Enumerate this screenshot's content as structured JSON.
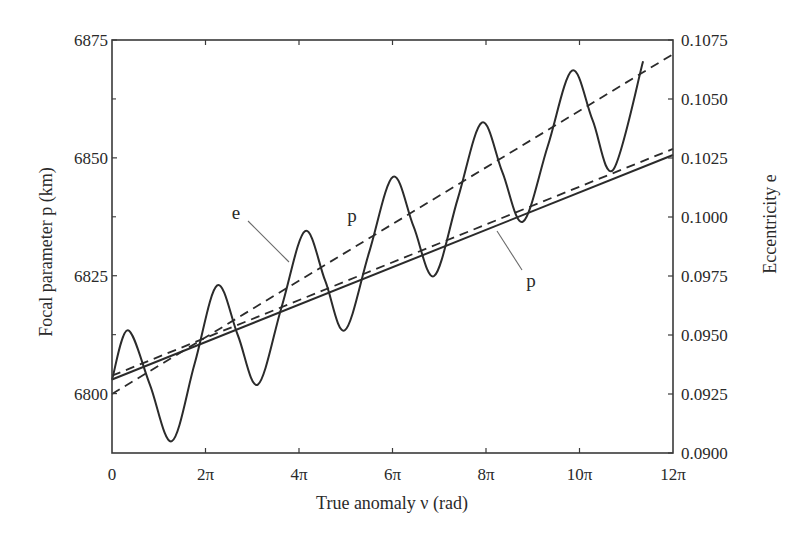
{
  "chart_data": {
    "type": "line",
    "title": "",
    "xlabel": "True anomaly ν (rad)",
    "ylabel": "Focal parameter p (km)",
    "ylabel_right": "Eccentricity e",
    "xlim_pi": [
      0,
      12
    ],
    "ylim": [
      6787.4,
      6875
    ],
    "ylim_right": [
      0.09,
      0.1075
    ],
    "grid": false,
    "legend": null,
    "x_ticks": [
      {
        "value_pi": 0,
        "label": "0"
      },
      {
        "value_pi": 2,
        "label": "2π"
      },
      {
        "value_pi": 4,
        "label": "4π"
      },
      {
        "value_pi": 6,
        "label": "6π"
      },
      {
        "value_pi": 8,
        "label": "8π"
      },
      {
        "value_pi": 10,
        "label": "10π"
      },
      {
        "value_pi": 12,
        "label": "12π"
      }
    ],
    "y_ticks": [
      {
        "value": 6800,
        "label": "6800"
      },
      {
        "value": 6825,
        "label": "6825"
      },
      {
        "value": 6850,
        "label": "6850"
      },
      {
        "value": 6875,
        "label": "6875"
      }
    ],
    "y_minor_ticks": [
      6812.5,
      6837.5,
      6862.5
    ],
    "y_right_ticks": [
      {
        "value": 0.09,
        "label": "0.0900"
      },
      {
        "value": 0.0925,
        "label": "0.0925"
      },
      {
        "value": 0.095,
        "label": "0.0950"
      },
      {
        "value": 0.0975,
        "label": "0.0975"
      },
      {
        "value": 0.1,
        "label": "0.1000"
      },
      {
        "value": 0.1025,
        "label": "0.1025"
      },
      {
        "value": 0.105,
        "label": "0.1050"
      },
      {
        "value": 0.1075,
        "label": "0.1075"
      }
    ],
    "series": [
      {
        "name": "e (osculating)",
        "axis": "right",
        "style": "solid",
        "smooth": true,
        "x_pi": [
          0,
          0.34,
          0.81,
          1.28,
          1.77,
          2.25,
          2.69,
          3.12,
          3.63,
          4.13,
          4.56,
          4.98,
          5.5,
          6.01,
          6.45,
          6.89,
          7.4,
          7.91,
          8.35,
          8.79,
          9.32,
          9.84,
          10.28,
          10.72,
          11.36
        ],
        "values": [
          0.0931,
          0.0952,
          0.0929,
          0.0905,
          0.0938,
          0.0971,
          0.095,
          0.0929,
          0.0962,
          0.0994,
          0.0973,
          0.0952,
          0.0985,
          0.1017,
          0.0996,
          0.0975,
          0.1008,
          0.104,
          0.1019,
          0.0998,
          0.103,
          0.1062,
          0.1041,
          0.102,
          0.1066
        ]
      },
      {
        "name": "e (mean)",
        "axis": "right",
        "style": "dashed",
        "x_pi": [
          0,
          12
        ],
        "values": [
          0.0925,
          0.1069
        ]
      },
      {
        "name": "p (solid)",
        "axis": "left",
        "style": "solid",
        "x_pi": [
          0,
          12
        ],
        "values": [
          6803.0,
          6850.6
        ]
      },
      {
        "name": "p (dashed)",
        "axis": "left",
        "style": "dashed",
        "x_pi": [
          0,
          12
        ],
        "values": [
          6803.8,
          6851.9
        ]
      }
    ],
    "annotations": [
      {
        "text": "e",
        "x_px": 236,
        "y_px": 219,
        "leader": [
          248,
          221,
          289,
          262
        ]
      },
      {
        "text": "p",
        "x_px": 352,
        "y_px": 222,
        "leader": null
      },
      {
        "text": "p",
        "x_px": 531,
        "y_px": 287,
        "leader": [
          497,
          231,
          522,
          270
        ]
      }
    ]
  },
  "colors": {
    "line": "#2b2b2b",
    "leader": "#6a6a6a",
    "frame": "#3a3a3a",
    "background": "#ffffff"
  }
}
